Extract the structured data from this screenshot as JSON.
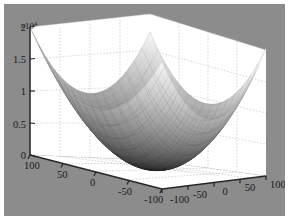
{
  "figure": {
    "title": "",
    "background_color": "#8c8c8c",
    "border_color": "#ffffff",
    "panel_color": "#ffffff",
    "grid_color": "#bdbdbd",
    "axis_color": "#262626",
    "tick_color": "#1a1a1a"
  },
  "axis_exponent": {
    "prefix": "×",
    "base": "10",
    "power": "4",
    "full": "×10⁴"
  },
  "chart_data": {
    "type": "surface",
    "title": "",
    "xlabel": "",
    "ylabel": "",
    "zlabel": "",
    "colormap": "gray",
    "shading": "faceted",
    "view": {
      "azimuth": -37.5,
      "elevation": 30
    },
    "grid": true,
    "legend": null,
    "function": "z = x^2 + y^2",
    "xlim": [
      -100,
      100
    ],
    "ylim": [
      -100,
      100
    ],
    "zlim": [
      0,
      20000
    ],
    "z_tick_exponent": 10000,
    "xticks": [
      -100,
      -50,
      0,
      50,
      100
    ],
    "yticks": [
      -100,
      -50,
      0,
      50,
      100
    ],
    "zticks": [
      0,
      5000,
      10000,
      15000,
      20000
    ],
    "xticklabels": [
      "-100",
      "-50",
      "0",
      "50",
      "100"
    ],
    "yticklabels": [
      "100",
      "50",
      "0",
      "-50",
      "-100"
    ],
    "zticklabels": [
      "0",
      "0.5",
      "1",
      "1.5",
      "2"
    ],
    "x": [
      -100,
      -75,
      -50,
      -25,
      0,
      25,
      50,
      75,
      100
    ],
    "y": [
      -100,
      -75,
      -50,
      -25,
      0,
      25,
      50,
      75,
      100
    ],
    "z": [
      [
        20000,
        15625,
        12500,
        10625,
        10000,
        10625,
        12500,
        15625,
        20000
      ],
      [
        15625,
        11250,
        8125,
        6250,
        5625,
        6250,
        8125,
        11250,
        15625
      ],
      [
        12500,
        8125,
        5000,
        3125,
        2500,
        3125,
        5000,
        8125,
        12500
      ],
      [
        10625,
        6250,
        3125,
        1250,
        625,
        1250,
        3125,
        6250,
        10625
      ],
      [
        10000,
        5625,
        2500,
        625,
        0,
        625,
        2500,
        5625,
        10000
      ],
      [
        10625,
        6250,
        3125,
        1250,
        625,
        1250,
        3125,
        6250,
        10625
      ],
      [
        12500,
        8125,
        5000,
        3125,
        2500,
        3125,
        5000,
        8125,
        12500
      ],
      [
        15625,
        11250,
        8125,
        6250,
        5625,
        6250,
        8125,
        11250,
        15625
      ],
      [
        20000,
        15625,
        12500,
        10625,
        10000,
        10625,
        12500,
        15625,
        20000
      ]
    ],
    "zmin": 0,
    "zmax": 20000
  },
  "z_axis": {
    "name": "z-axis",
    "ticks": [
      {
        "label": "2",
        "value": 20000
      },
      {
        "label": "1.5",
        "value": 15000
      },
      {
        "label": "1",
        "value": 10000
      },
      {
        "label": "0.5",
        "value": 5000
      },
      {
        "label": "0",
        "value": 0
      }
    ]
  },
  "y_axis": {
    "name": "y-axis-left",
    "ticks": [
      {
        "label": "100",
        "value": 100
      },
      {
        "label": "50",
        "value": 50
      },
      {
        "label": "0",
        "value": 0
      },
      {
        "label": "-50",
        "value": -50
      },
      {
        "label": "-100",
        "value": -100
      }
    ]
  },
  "x_axis": {
    "name": "x-axis-right",
    "ticks": [
      {
        "label": "-100",
        "value": -100
      },
      {
        "label": "-50",
        "value": -50
      },
      {
        "label": "0",
        "value": 0
      },
      {
        "label": "50",
        "value": 50
      },
      {
        "label": "100",
        "value": 100
      }
    ]
  }
}
